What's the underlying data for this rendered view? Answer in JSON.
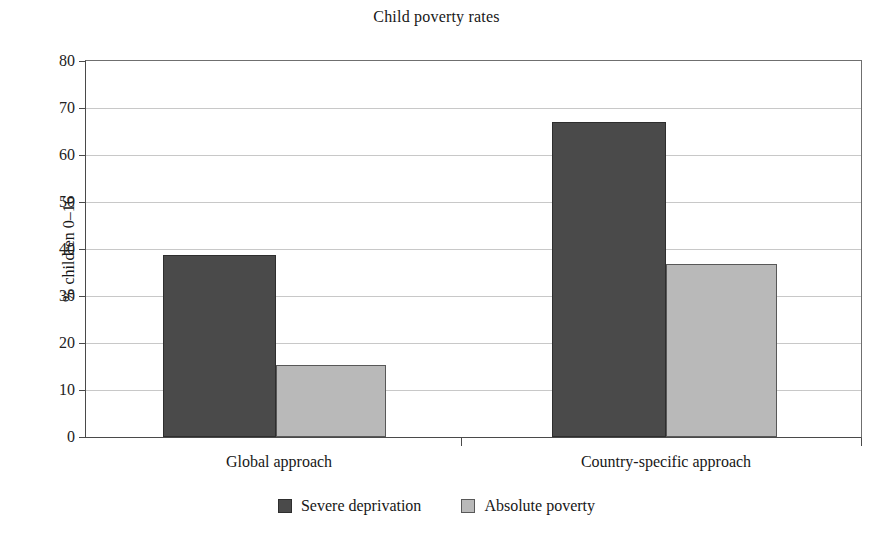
{
  "chart_data": {
    "type": "bar",
    "title": "Child poverty rates",
    "xlabel": "",
    "ylabel": "% children 0–16",
    "categories": [
      "Global approach",
      "Country-specific approach"
    ],
    "series": [
      {
        "name": "Severe deprivation",
        "color": "#4a4a4a",
        "values": [
          38.8,
          67.0
        ]
      },
      {
        "name": "Absolute poverty",
        "color": "#b9b9b9",
        "values": [
          15.3,
          36.9
        ]
      }
    ],
    "ylim": [
      0,
      80
    ],
    "ytick_values": [
      0,
      10,
      20,
      30,
      40,
      50,
      60,
      70,
      80
    ],
    "ytick_labels": [
      "0",
      "10",
      "20",
      "30",
      "40",
      "50",
      "60",
      "70",
      "80"
    ],
    "grid": true,
    "grid_axis": "y",
    "legend_position": "bottom-center",
    "legend_entries": [
      "Severe deprivation",
      "Absolute poverty"
    ]
  }
}
